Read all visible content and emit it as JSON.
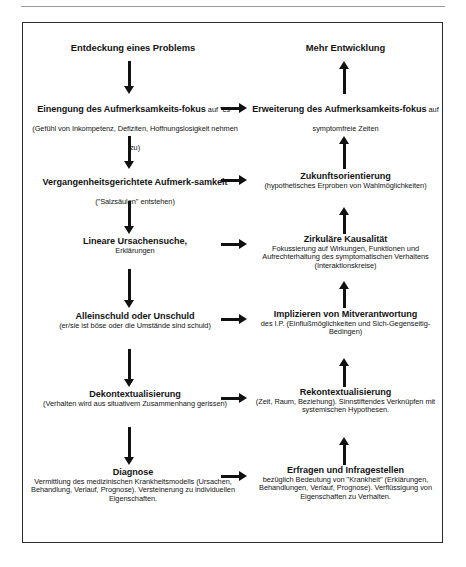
{
  "diagram": {
    "title_left": "Entdeckung eines Problems",
    "title_right": "Mehr Entwicklung",
    "left_column": [
      {
        "heading": "Einengung des Aufmerksamkeits-fokus",
        "sub": " auf \"es\" (Gefühl von Inkompetenz, Defiziten, Hoffnungslosigkeit nehmen zu)"
      },
      {
        "heading": "Vergangenheitsgerichtete Aufmerk-samkeit",
        "sub": " (\"Salzsäulen\" entstehen)"
      },
      {
        "heading": "Lineare Ursachensuche,",
        "sub": "Erklärungen"
      },
      {
        "heading": "Alleinschuld oder Unschuld",
        "sub": "(er/sie ist böse oder die Umstände sind schuld)"
      },
      {
        "heading": "Dekontextualisierung",
        "sub": "(Verhalten wird aus situativem Zusammenhang gerissen)"
      },
      {
        "heading": "Diagnose",
        "sub": "Vermittlung des medizinischen Krankheitsmodells (Ursachen, Behandlung, Verlauf, Prognose). Versteinerung zu individuellen Eigenschaften."
      }
    ],
    "right_column": [
      {
        "heading": "Erweiterung des Aufmerksamkeits-fokus",
        "sub": " auf symptomfreie Zeiten"
      },
      {
        "heading": "Zukunftsorientierung",
        "sub": "(hypothetisches Erproben von Wahlmöglichkeiten)"
      },
      {
        "heading": "Zirkuläre Kausalität",
        "sub": "Fokussierung auf Wirkungen, Funktionen und Aufrechterhaltung des symptomatischen Verhaltens (Interaktionskreise)"
      },
      {
        "heading": "Implizieren von Mitverantwortung",
        "sub": "des I.P. (Einflußmöglichkeiten und Sich-Gegenseitig-Bedingen)"
      },
      {
        "heading": "Rekontextualisierung",
        "sub": "(Zeit, Raum, Beziehung). Sinnstiftendes Verknüpfen mit systemischen Hypothesen."
      },
      {
        "heading": "Erfragen und Infragestellen",
        "sub": "bezüglich Bedeutung von \"Krankheit\" (Erklärungen, Behandlungen, Verlauf, Prognose). Verflüssigung von Eigenschaften zu Verhalten."
      }
    ],
    "colors": {
      "ink": "#141414",
      "arrow": "#111111",
      "frame": "#2b2b2b",
      "rule": "#9a9a9a"
    }
  }
}
